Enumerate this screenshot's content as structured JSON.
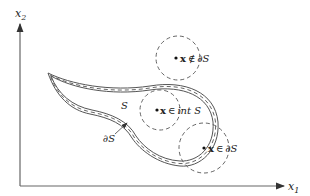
{
  "axes": {
    "x_label": "x",
    "x_sub": "1",
    "y_label": "x",
    "y_sub": "2"
  },
  "set": {
    "name": "S",
    "boundary_label": "∂S"
  },
  "points": [
    {
      "var": "x",
      "relation": "∉",
      "set": "∂S",
      "description": "exterior point"
    },
    {
      "var": "x",
      "relation": "∈",
      "set": "int S",
      "description": "interior point"
    },
    {
      "var": "x",
      "relation": "∈",
      "set": "∂S",
      "description": "boundary point"
    }
  ],
  "colors": {
    "line": "#555555",
    "text": "#222222",
    "background": "#ffffff"
  }
}
